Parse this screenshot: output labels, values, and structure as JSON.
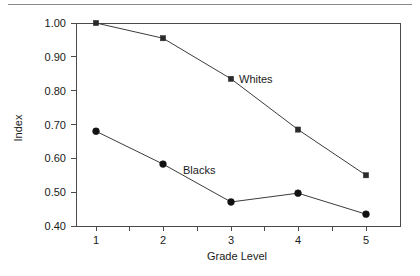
{
  "chart_data": {
    "type": "line",
    "title": "",
    "subtitle": "",
    "xlabel": "Grade Level",
    "ylabel": "Index",
    "categories": [
      "1",
      "2",
      "3",
      "4",
      "5"
    ],
    "x": [
      1,
      2,
      3,
      4,
      5
    ],
    "xlim": [
      0.6,
      5.4
    ],
    "ylim": [
      0.4,
      1.0
    ],
    "ytick_labels": [
      "1.00",
      "0.90",
      "0.80",
      "0.70",
      "0.60",
      "0.50",
      "0.40"
    ],
    "ytick_values": [
      1.0,
      0.9,
      0.8,
      0.7,
      0.6,
      0.5,
      0.4
    ],
    "xtick_labels": [
      "1",
      "2",
      "3",
      "4",
      "5"
    ],
    "grid": false,
    "legend_position": "inline-annotations",
    "series": [
      {
        "name": "Whites",
        "marker": "square",
        "values": [
          1.0,
          0.955,
          0.835,
          0.685,
          0.55
        ],
        "label_text": "Whites"
      },
      {
        "name": "Blacks",
        "marker": "circle",
        "values": [
          0.68,
          0.583,
          0.471,
          0.497,
          0.435
        ],
        "label_text": "Blacks"
      }
    ],
    "annotations": [
      {
        "text": "Whites",
        "x": 3,
        "y": 0.835
      },
      {
        "text": "Blacks",
        "x": 2,
        "y": 0.583
      }
    ],
    "colors": {
      "line": "#3c3c3c",
      "marker_whites": "#2b2b2b",
      "marker_blacks": "#121212",
      "axis": "#4a4a4a",
      "text": "#1a1a1a",
      "background": "#ffffff",
      "top_rule": "#8a8a8a"
    }
  }
}
